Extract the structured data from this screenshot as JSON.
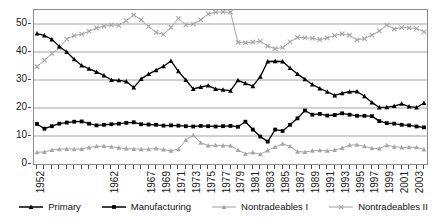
{
  "chart_data": {
    "type": "line",
    "title": "",
    "xlabel": "",
    "ylabel": "",
    "ylim": [
      0,
      55
    ],
    "yticks": [
      0,
      10,
      20,
      30,
      40,
      50
    ],
    "grid": "horizontal",
    "legend_position": "bottom",
    "x": [
      1952,
      1953,
      1954,
      1955,
      1956,
      1957,
      1958,
      1959,
      1960,
      1961,
      1962,
      1963,
      1964,
      1965,
      1966,
      1967,
      1968,
      1969,
      1970,
      1971,
      1972,
      1973,
      1974,
      1975,
      1976,
      1977,
      1978,
      1979,
      1980,
      1981,
      1982,
      1983,
      1984,
      1985,
      1986,
      1987,
      1988,
      1989,
      1990,
      1991,
      1992,
      1993,
      1994,
      1995,
      1996,
      1997,
      1998,
      1999,
      2000,
      2001,
      2002,
      2003,
      2004
    ],
    "xtick_labels": [
      "1952",
      "1962",
      "1967",
      "1969",
      "1971",
      "1973",
      "1975",
      "1977",
      "1979",
      "1981",
      "1983",
      "1985",
      "1987",
      "1989",
      "1991",
      "1993",
      "1995",
      "1997",
      "1999",
      "2001",
      "2003"
    ],
    "xtick_values": [
      1952,
      1962,
      1967,
      1969,
      1971,
      1973,
      1975,
      1977,
      1979,
      1981,
      1983,
      1985,
      1987,
      1989,
      1991,
      1993,
      1995,
      1997,
      1999,
      2001,
      2003
    ],
    "series": [
      {
        "name": "Primary",
        "color": "#000000",
        "marker": "triangle",
        "values": [
          46.6,
          45.9,
          44.5,
          42.0,
          40.0,
          37.4,
          35.2,
          34.0,
          32.9,
          31.6,
          30.0,
          29.9,
          29.5,
          27.3,
          30.4,
          32.1,
          33.5,
          34.9,
          36.8,
          33.1,
          30.0,
          26.8,
          27.5,
          28.0,
          26.8,
          26.5,
          26.2,
          29.9,
          28.8,
          27.8,
          31.2,
          36.6,
          36.7,
          36.6,
          34.3,
          32.1,
          30.3,
          28.4,
          27.0,
          25.8,
          24.5,
          25.3,
          25.8,
          25.9,
          24.2,
          22.0,
          20.2,
          20.3,
          20.7,
          21.5,
          20.5,
          20.2,
          21.8
        ]
      },
      {
        "name": "Manufacturing",
        "color": "#000000",
        "marker": "square",
        "values": [
          14.3,
          12.6,
          13.5,
          14.4,
          14.8,
          15.1,
          15.2,
          14.4,
          13.8,
          14.0,
          14.2,
          14.4,
          14.7,
          14.9,
          14.2,
          14.1,
          14.0,
          13.7,
          13.8,
          13.7,
          13.5,
          13.4,
          13.6,
          13.5,
          13.4,
          13.5,
          13.6,
          13.3,
          15.1,
          12.3,
          9.8,
          8.0,
          12.3,
          11.8,
          14.0,
          16.3,
          19.1,
          17.6,
          17.9,
          17.3,
          17.5,
          18.1,
          17.6,
          17.2,
          17.2,
          17.1,
          15.3,
          14.6,
          14.4,
          14.0,
          13.8,
          13.4,
          13.1
        ]
      },
      {
        "name": "Nontradeables I",
        "color": "#a6a6a6",
        "marker": "triangle",
        "values": [
          4.2,
          4.3,
          5.0,
          5.3,
          5.4,
          5.3,
          5.4,
          5.9,
          6.3,
          6.4,
          6.2,
          5.8,
          5.5,
          5.4,
          5.3,
          5.3,
          5.5,
          5.2,
          4.7,
          5.3,
          8.6,
          10.3,
          7.6,
          6.6,
          6.7,
          6.6,
          6.5,
          5.0,
          3.7,
          4.1,
          3.5,
          4.8,
          6.1,
          7.2,
          6.3,
          4.4,
          4.3,
          4.7,
          4.9,
          4.7,
          5.0,
          5.7,
          6.7,
          6.9,
          6.3,
          5.6,
          5.5,
          6.7,
          6.2,
          5.9,
          6.0,
          6.0,
          5.2
        ]
      },
      {
        "name": "Nontradeables II",
        "color": "#a6a6a6",
        "marker": "cross",
        "values": [
          34.8,
          37.0,
          39.4,
          41.5,
          44.6,
          45.8,
          46.4,
          47.4,
          48.6,
          49.2,
          49.7,
          49.5,
          51.2,
          53.2,
          51.5,
          49.1,
          47.0,
          46.3,
          48.8,
          52.0,
          49.7,
          50.0,
          51.5,
          53.6,
          54.2,
          54.3,
          54.2,
          43.4,
          43.3,
          43.5,
          43.9,
          42.1,
          41.2,
          41.6,
          43.6,
          45.2,
          45.1,
          44.9,
          44.4,
          45.0,
          45.9,
          46.5,
          46.0,
          44.3,
          44.8,
          46.0,
          47.5,
          49.6,
          48.2,
          48.7,
          48.6,
          48.4,
          47.2
        ]
      }
    ]
  },
  "legend": {
    "items": [
      {
        "label": "Primary"
      },
      {
        "label": "Manufacturing"
      },
      {
        "label": "Nontradeables I"
      },
      {
        "label": "Nontradeables II"
      }
    ]
  }
}
